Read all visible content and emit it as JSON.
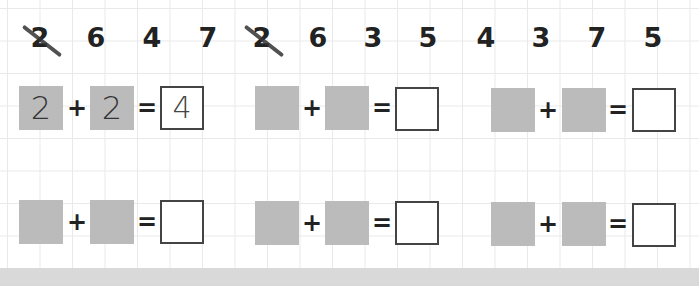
{
  "number_row": [
    {
      "value": "2",
      "crossed": true
    },
    {
      "value": "6",
      "crossed": false
    },
    {
      "value": "4",
      "crossed": false
    },
    {
      "value": "7",
      "crossed": false
    },
    {
      "value": "2",
      "crossed": true
    },
    {
      "value": "6",
      "crossed": false
    },
    {
      "value": "3",
      "crossed": false
    },
    {
      "value": "5",
      "crossed": false
    },
    {
      "value": "4",
      "crossed": false
    },
    {
      "value": "3",
      "crossed": false
    },
    {
      "value": "7",
      "crossed": false
    },
    {
      "value": "5",
      "crossed": false
    }
  ],
  "equations": [
    {
      "a": "2",
      "b": "2",
      "result": "4",
      "plus": "+",
      "equals": "="
    },
    {
      "a": "",
      "b": "",
      "result": "",
      "plus": "+",
      "equals": "="
    },
    {
      "a": "",
      "b": "",
      "result": "",
      "plus": "+",
      "equals": "="
    },
    {
      "a": "",
      "b": "",
      "result": "",
      "plus": "+",
      "equals": "="
    },
    {
      "a": "",
      "b": "",
      "result": "",
      "plus": "+",
      "equals": "="
    },
    {
      "a": "",
      "b": "",
      "result": "",
      "plus": "+",
      "equals": "="
    }
  ],
  "colors": {
    "addend_box": "#bbbbbb",
    "result_border": "#444444",
    "grid": "#e9e9e9",
    "band": "#d9d9d9"
  }
}
